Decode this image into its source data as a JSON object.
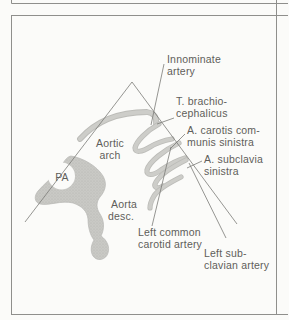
{
  "figure": {
    "labels": {
      "innominate": {
        "l1": "Innominate",
        "l2": "artery"
      },
      "brachiocephalicus": {
        "l1": "T. brachio-",
        "l2": "cephalicus"
      },
      "carotis": {
        "l1": "A. carotis com-",
        "l2": "munis sinistra"
      },
      "subclavia": {
        "l1": "A. subclavia",
        "l2": "sinistra"
      },
      "aortic_arch": {
        "l1": "Aortic",
        "l2": "arch"
      },
      "pa": "PA",
      "aorta_desc": {
        "l1": "Aorta",
        "l2": "desc."
      },
      "left_common": {
        "l1": "Left common",
        "l2": "carotid artery"
      },
      "left_subclavian": {
        "l1": "Left sub-",
        "l2": "clavian artery"
      }
    },
    "colors": {
      "background": "#fbfbf9",
      "frame": "#8f8f8c",
      "line": "#7b7b77",
      "text": "#5f5e5a",
      "vessel_edge": "#bcbcb8",
      "vessel_fill": "#cbcbc7"
    }
  }
}
